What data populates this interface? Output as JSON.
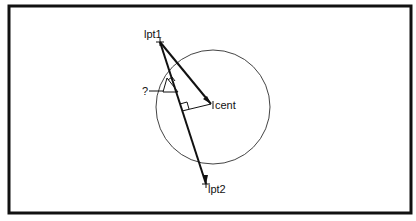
{
  "diagram": {
    "labels": {
      "lpt1": "lpt1",
      "lpt2": "lpt2",
      "cent": "cent",
      "question": "?"
    },
    "colors": {
      "stroke": "#111111",
      "circle": "#444444",
      "background": "#ffffff"
    }
  }
}
